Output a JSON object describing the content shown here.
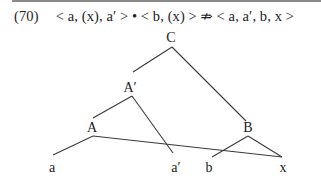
{
  "example": {
    "number": "(70)",
    "formula_parts": {
      "left1": "< a, (x), a′ >",
      "op": "•",
      "left2": "< b, (x) >",
      "relation": "⇏",
      "right": "< a, a′, b, x >"
    }
  },
  "tree": {
    "nodes": [
      {
        "id": "C",
        "label": "C",
        "x": 171,
        "y": 38
      },
      {
        "id": "A-prime",
        "label": "A′",
        "x": 130,
        "y": 88
      },
      {
        "id": "A",
        "label": "A",
        "x": 92,
        "y": 128
      },
      {
        "id": "B",
        "label": "B",
        "x": 248,
        "y": 128
      },
      {
        "id": "a",
        "label": "a",
        "x": 52,
        "y": 168
      },
      {
        "id": "a-prime",
        "label": "a′",
        "x": 176,
        "y": 168
      },
      {
        "id": "b",
        "label": "b",
        "x": 209,
        "y": 168
      },
      {
        "id": "x",
        "label": "x",
        "x": 283,
        "y": 168
      }
    ],
    "edges": [
      {
        "from": "C",
        "to": "A-prime"
      },
      {
        "from": "C",
        "to": "B"
      },
      {
        "from": "A-prime",
        "to": "A"
      },
      {
        "from": "A-prime",
        "to": "a-prime"
      },
      {
        "from": "A",
        "to": "a"
      },
      {
        "from": "A",
        "to": "x"
      },
      {
        "from": "B",
        "to": "b"
      },
      {
        "from": "B",
        "to": "x"
      }
    ]
  }
}
